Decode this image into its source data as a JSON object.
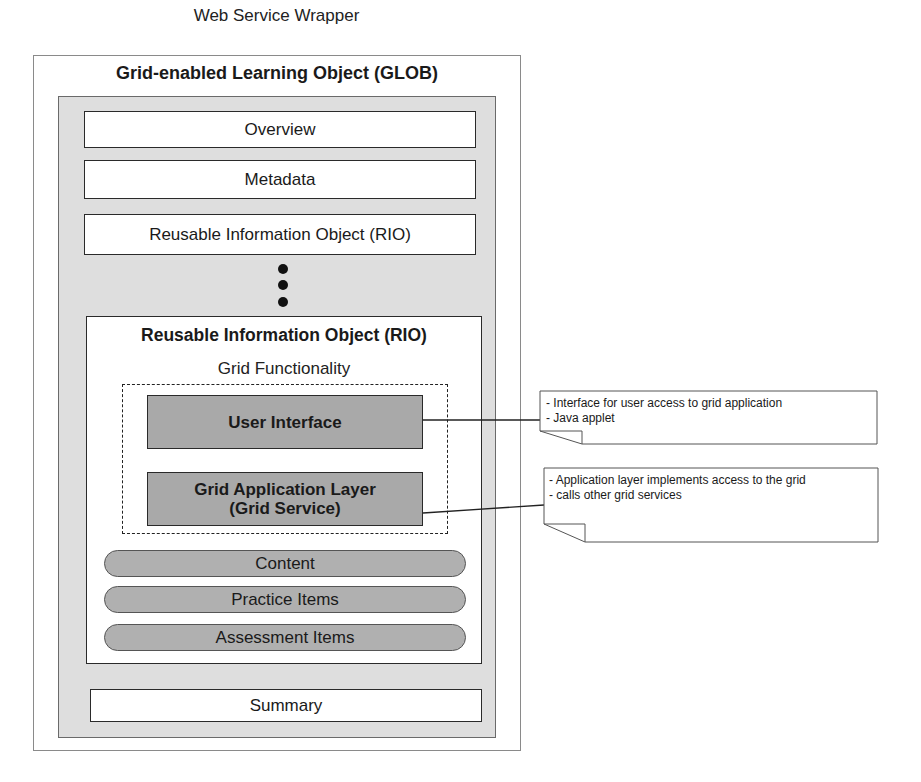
{
  "diagram": {
    "wrapper_title": "Web Service Wrapper",
    "glob_title": "Grid-enabled Learning Object (GLOB)",
    "sections": {
      "overview": "Overview",
      "metadata": "Metadata",
      "rio_collapsed": "Reusable Information Object (RIO)",
      "summary": "Summary"
    },
    "ellipsis_dots": 3,
    "rio_expanded": {
      "title": "Reusable Information Object (RIO)",
      "grid_functionality_label": "Grid Functionality",
      "user_interface": "User Interface",
      "grid_application_layer_line1": "Grid Application Layer",
      "grid_application_layer_line2": "(Grid Service)",
      "items": [
        "Content",
        "Practice Items",
        "Assessment Items"
      ]
    },
    "notes": [
      {
        "lines": [
          "- Interface for user access to grid application",
          "- Java applet"
        ]
      },
      {
        "lines": [
          "- Application layer implements access to the grid",
          "- calls other grid services"
        ]
      }
    ]
  },
  "colors": {
    "panel_gray": "#dedede",
    "component_gray": "#a9a9a9",
    "pill_gray": "#b0b0b0",
    "border": "#2a2a2a"
  }
}
